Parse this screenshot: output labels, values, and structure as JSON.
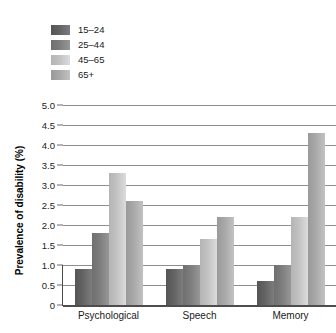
{
  "chart_data": {
    "type": "bar",
    "title": "",
    "subtitle": "",
    "xlabel": "",
    "ylabel": "Prevalence of disability (%)",
    "categories": [
      "Psychological",
      "Speech",
      "Memory"
    ],
    "series": [
      {
        "name": "15–24",
        "color": "#636363",
        "values": [
          0.9,
          0.9,
          0.6
        ]
      },
      {
        "name": "25–44",
        "color": "#7d7d7d",
        "values": [
          1.8,
          1.0,
          1.0
        ]
      },
      {
        "name": "45–65",
        "color": "#c2c2c2",
        "values": [
          3.3,
          1.65,
          2.2
        ]
      },
      {
        "name": "65+",
        "color": "#a8a8a8",
        "values": [
          2.6,
          2.2,
          4.3
        ]
      }
    ],
    "ylim": [
      0,
      5.0
    ],
    "y_ticks": [
      "0",
      "0.5",
      "1.0",
      "1.5",
      "2.0",
      "2.5",
      "3.0",
      "3.5",
      "4.0",
      "4.5",
      "5.0"
    ],
    "y_tick_values": [
      0,
      0.5,
      1.0,
      1.5,
      2.0,
      2.5,
      3.0,
      3.5,
      4.0,
      4.5,
      5.0
    ],
    "grid": true,
    "legend_position": "top-left",
    "orientation": "vertical",
    "grouping": "grouped"
  },
  "legend": {
    "entries": [
      {
        "label": "15–24",
        "color": "#636363"
      },
      {
        "label": "25–44",
        "color": "#7d7d7d"
      },
      {
        "label": "45–65",
        "color": "#c2c2c2"
      },
      {
        "label": "65+",
        "color": "#a8a8a8"
      }
    ]
  }
}
